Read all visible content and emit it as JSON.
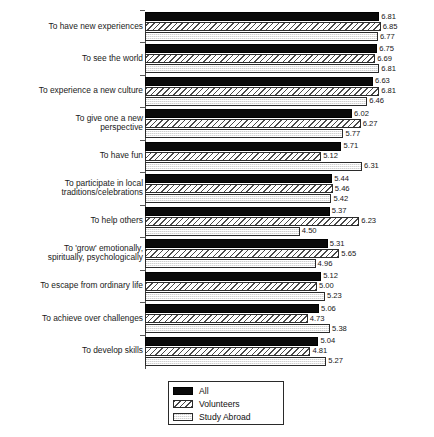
{
  "chart_data": {
    "type": "bar",
    "orientation": "horizontal",
    "title": "",
    "subtitle": "",
    "xlabel": "",
    "ylabel": "",
    "xlim": [
      0,
      7
    ],
    "grid": false,
    "legend_position": "bottom-center",
    "categories": [
      "To have new experiences",
      "To see the world",
      "To experience a new culture",
      "To give one a new\nperspective",
      "To have fun",
      "To participate in local\ntraditions/celebrations",
      "To help others",
      "To 'grow' emotionally,\nspiritually, psychologically",
      "To escape from ordinary life",
      "To achieve over challenges",
      "To develop skills"
    ],
    "series": [
      {
        "name": "All",
        "key": "all",
        "values": [
          6.81,
          6.75,
          6.63,
          6.02,
          5.71,
          5.44,
          5.37,
          5.31,
          5.12,
          5.06,
          5.04
        ]
      },
      {
        "name": "Volunteers",
        "key": "vol",
        "values": [
          6.85,
          6.69,
          6.81,
          6.27,
          5.12,
          5.46,
          6.23,
          5.65,
          5.0,
          4.73,
          4.81
        ]
      },
      {
        "name": "Study Abroad",
        "key": "abroad",
        "values": [
          6.77,
          6.81,
          6.46,
          5.77,
          6.31,
          5.42,
          4.5,
          4.96,
          5.23,
          5.38,
          5.27
        ]
      }
    ],
    "value_labels": [
      [
        "6.81",
        "6.85",
        "6.77"
      ],
      [
        "6.75",
        "6.69",
        "6.81"
      ],
      [
        "6.63",
        "6.81",
        "6.46"
      ],
      [
        "6.02",
        "6.27",
        "5.77"
      ],
      [
        "5.71",
        "5.12",
        "6.31"
      ],
      [
        "5.44",
        "5.46",
        "5.42"
      ],
      [
        "5.37",
        "6.23",
        "4.50"
      ],
      [
        "5.31",
        "5.65",
        "4.96"
      ],
      [
        "5.12",
        "5.00",
        "5.23"
      ],
      [
        "5.06",
        "4.73",
        "5.38"
      ],
      [
        "5.04",
        "4.81",
        "5.27"
      ]
    ]
  },
  "legend": {
    "items": [
      {
        "label": "All",
        "key": "all"
      },
      {
        "label": "Volunteers",
        "key": "vol"
      },
      {
        "label": "Study Abroad",
        "key": "abroad"
      }
    ]
  },
  "colors": {
    "all": "#0a0a0a",
    "volunteers": "#f2f2f2",
    "study_abroad": "#e9e9e9",
    "axis": "#4a4a4a",
    "text": "#111111",
    "background": "#ffffff"
  }
}
